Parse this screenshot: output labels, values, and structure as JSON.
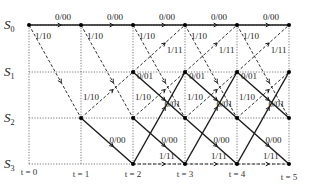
{
  "diagram": {
    "type": "trellis",
    "states": [
      "S0",
      "S1",
      "S2",
      "S3"
    ],
    "time_labels": [
      "t = 0",
      "t = 1",
      "t = 2",
      "t = 3",
      "t = 4",
      "t = 5"
    ],
    "columns_x": [
      29,
      81,
      133,
      185,
      237,
      289
    ],
    "rows_y": [
      25,
      72,
      118,
      164
    ],
    "transitions": [
      {
        "from": "S0",
        "to": "S0",
        "label": "0/00",
        "style": "solid"
      },
      {
        "from": "S0",
        "to": "S2",
        "label": "1/10",
        "style": "dashed"
      },
      {
        "from": "S1",
        "to": "S0",
        "label": "1/11",
        "style": "dashed"
      },
      {
        "from": "S1",
        "to": "S2",
        "label": "0/01",
        "style": "solid"
      },
      {
        "from": "S2",
        "to": "S1",
        "label": "1/10",
        "style": "dashed"
      },
      {
        "from": "S2",
        "to": "S3",
        "label": "0/00",
        "style": "solid"
      },
      {
        "from": "S3",
        "to": "S1",
        "label": "0/01",
        "style": "solid"
      },
      {
        "from": "S3",
        "to": "S3",
        "label": "1/11",
        "style": "dashed"
      }
    ],
    "colors": {
      "line": "#1a1a1a",
      "grid": "#555555",
      "node": "#000000"
    }
  }
}
